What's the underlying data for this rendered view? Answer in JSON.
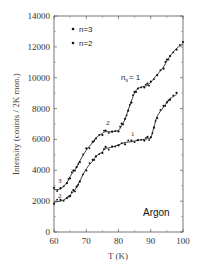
{
  "chart_data": {
    "type": "line",
    "title": "",
    "xlabel": "T (K)",
    "ylabel": "Intensity (counts / 2K mon.)",
    "xlim": [
      60,
      100
    ],
    "ylim": [
      0,
      14000
    ],
    "x_ticks": [
      60,
      70,
      80,
      90,
      100
    ],
    "y_ticks": [
      0,
      2000,
      4000,
      6000,
      8000,
      10000,
      12000,
      14000
    ],
    "grid": false,
    "legend_position": "upper-left",
    "legend": [
      "n=3",
      "n=2"
    ],
    "annotations": [
      {
        "text": "n_s = 1",
        "x": 85,
        "y": 10100
      },
      {
        "text": "2",
        "x": 76.5,
        "y": 6900
      },
      {
        "text": "1",
        "x": 84.5,
        "y": 6200
      },
      {
        "text": "3",
        "x": 61.5,
        "y": 3400
      },
      {
        "text": "2",
        "x": 61.5,
        "y": 2400
      },
      {
        "text": "Argon",
        "x": 94,
        "y": 1200
      }
    ],
    "series": [
      {
        "name": "n=3",
        "x": [
          60,
          62,
          64,
          65,
          66,
          67,
          68,
          70,
          72,
          73,
          75,
          76,
          78,
          80,
          81,
          82,
          83,
          84,
          85,
          86,
          88,
          89,
          90,
          92,
          94,
          95,
          96,
          98,
          100
        ],
        "values": [
          2750,
          2800,
          3200,
          3600,
          3900,
          4200,
          4600,
          5300,
          5800,
          6100,
          6400,
          6500,
          6500,
          6600,
          6900,
          7300,
          7900,
          8500,
          9000,
          9300,
          9450,
          9500,
          9700,
          10200,
          10700,
          11100,
          11400,
          11900,
          12200
        ]
      },
      {
        "name": "n=2",
        "x": [
          60,
          62,
          64,
          65,
          66,
          67,
          68,
          70,
          72,
          73,
          75,
          76,
          78,
          80,
          82,
          84,
          86,
          88,
          89,
          90,
          91,
          92,
          94,
          95,
          96,
          98
        ],
        "values": [
          1950,
          2000,
          2200,
          2400,
          2600,
          2900,
          3300,
          4100,
          4600,
          4900,
          5200,
          5400,
          5500,
          5650,
          5800,
          5850,
          5950,
          6000,
          6050,
          6100,
          6800,
          7500,
          8100,
          8400,
          8650,
          8900
        ]
      }
    ]
  },
  "labels": {
    "y_ticks": [
      "0",
      "2000",
      "4000",
      "6000",
      "8000",
      "10000",
      "12000",
      "14000"
    ],
    "x_ticks": [
      "60",
      "70",
      "80",
      "90",
      "100"
    ],
    "xlabel": "T (K)",
    "ylabel": "Intensity (counts / 2K mon.)",
    "legend_n3": "n=3",
    "legend_n2": "n=2",
    "anno_ns": "n",
    "anno_ns_sub": "s",
    "anno_ns_eq": "= 1",
    "anno_upper_2": "2",
    "anno_lower_1": "1",
    "anno_upper_3": "3",
    "anno_lower_2": "2",
    "sample": "Argon"
  }
}
